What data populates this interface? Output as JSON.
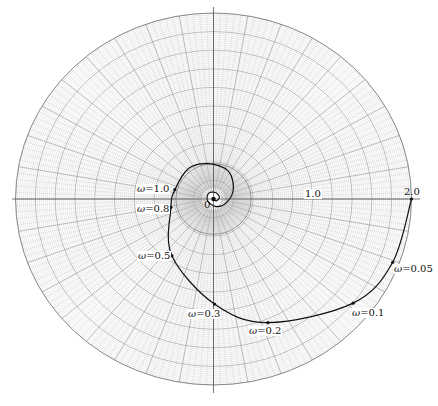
{
  "chart_data": {
    "type": "line",
    "subtype": "polar-nyquist",
    "title": "",
    "xlabel": "",
    "ylabel": "",
    "grid": true,
    "grid_style": "polar graph paper (concentric circles and radial lines)",
    "axis_range": {
      "radius_max": 2.0
    },
    "axis_labels": [
      {
        "text": "0",
        "value": 0
      },
      {
        "text": "1.0",
        "value": 1.0
      },
      {
        "text": "2.0",
        "value": 2.0
      }
    ],
    "series": [
      {
        "name": "frequency response",
        "points": [
          {
            "omega": 0.0,
            "re": 2.0,
            "im": 0.0
          },
          {
            "omega": 0.05,
            "re": 1.81,
            "im": -0.68
          },
          {
            "omega": 0.1,
            "re": 1.41,
            "im": -1.12
          },
          {
            "omega": 0.2,
            "re": 0.55,
            "im": -1.33
          },
          {
            "omega": 0.3,
            "re": 0.01,
            "im": -1.13
          },
          {
            "omega": 0.5,
            "re": -0.42,
            "im": -0.61
          },
          {
            "omega": 0.8,
            "re": -0.43,
            "im": -0.09
          },
          {
            "omega": 1.0,
            "re": -0.39,
            "im": 0.1
          }
        ]
      }
    ],
    "annotations": [
      {
        "text": "ω=0.05",
        "omega": 0.05
      },
      {
        "text": "ω=0.1",
        "omega": 0.1
      },
      {
        "text": "ω=0.2",
        "omega": 0.2
      },
      {
        "text": "ω=0.3",
        "omega": 0.3
      },
      {
        "text": "ω=0.5",
        "omega": 0.5
      },
      {
        "text": "ω=0.8",
        "omega": 0.8
      },
      {
        "text": "ω=1.0",
        "omega": 1.0
      }
    ],
    "legend": null
  },
  "labels": {
    "origin": "0",
    "r1": "1.0",
    "r2": "2.0",
    "w005": "=0.05",
    "w01": "=0.1",
    "w02": "=0.2",
    "w03": "=0.3",
    "w05": "=0.5",
    "w08": "=0.8",
    "w10": "=1.0",
    "omega": "ω"
  },
  "colors": {
    "grid": "#8a8a8a",
    "grid_fine": "#c4c4c4",
    "curve": "#111111"
  }
}
